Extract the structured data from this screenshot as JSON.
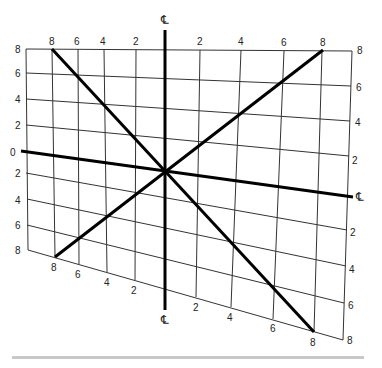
{
  "diagram": {
    "title": "",
    "centerline_symbol": "℄",
    "colors": {
      "grid": "#333333",
      "heavy": "#000000",
      "label": "#222222",
      "bottom_bar": "#c8c8c8"
    },
    "top_labels": [
      "8",
      "6",
      "4",
      "2",
      "2",
      "4",
      "6",
      "8"
    ],
    "left_labels": [
      "8",
      "6",
      "4",
      "2",
      "0",
      "2",
      "4",
      "6",
      "8"
    ],
    "right_labels": [
      "8",
      "6",
      "4",
      "2",
      "2",
      "4",
      "6",
      "8"
    ],
    "bottom_labels": [
      "8",
      "6",
      "4",
      "2",
      "2",
      "4",
      "6",
      "8"
    ],
    "corner_label_top_right": "8",
    "corner_label_bottom_right": "8",
    "centerline_labels": {
      "top": "℄",
      "bottom": "℄",
      "right": "℄"
    }
  }
}
